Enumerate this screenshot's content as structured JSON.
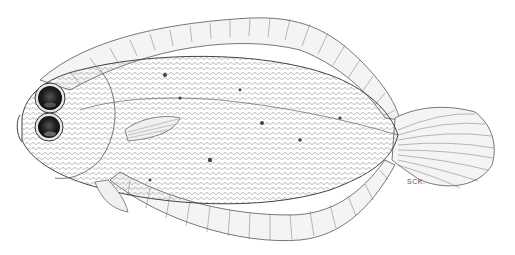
{
  "figure": {
    "signature": "SCK.",
    "colors": {
      "background": "#ffffff",
      "ink": "#333333",
      "eye": "#1a1a1a",
      "spots": "#444444"
    }
  }
}
